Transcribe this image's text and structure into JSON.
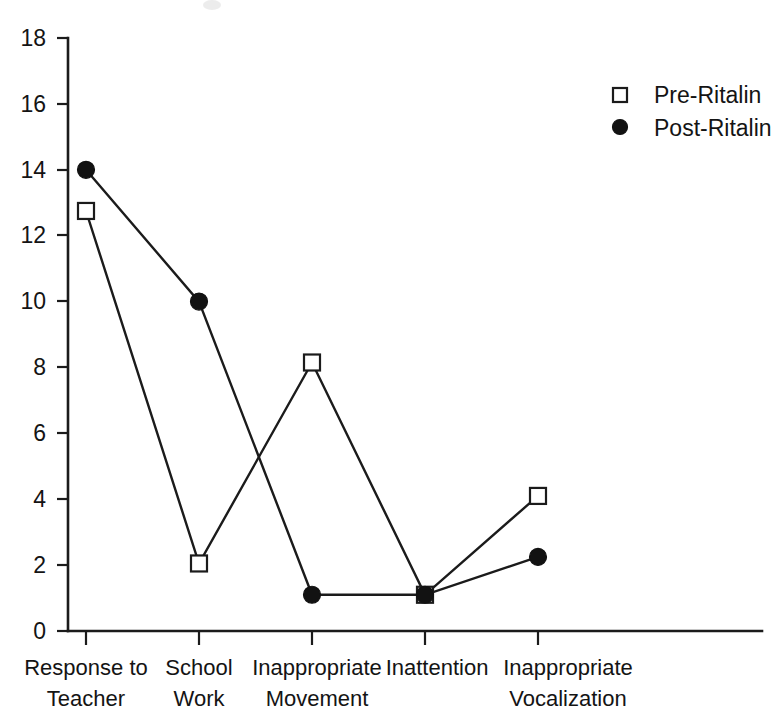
{
  "chart_data": {
    "type": "line",
    "title": "",
    "subtitle": "",
    "xlabel": "",
    "ylabel": "",
    "categories": [
      "Response to\nTeacher",
      "School\nWork",
      "Inappropriate\nMovement",
      "Inattention",
      "Inappropriate\nVocalization"
    ],
    "category_lines": [
      [
        "Response to",
        "Teacher"
      ],
      [
        "School",
        "Work"
      ],
      [
        "Inappropriate",
        "Movement"
      ],
      [
        "Inattention",
        ""
      ],
      [
        "Inappropriate",
        "Vocalization"
      ]
    ],
    "series": [
      {
        "name": "Pre-Ritalin",
        "marker": "open-square",
        "values": [
          12.75,
          2.05,
          8.15,
          1.1,
          4.1
        ]
      },
      {
        "name": "Post-Ritalin",
        "marker": "filled-circle",
        "values": [
          14.0,
          10.0,
          1.1,
          1.1,
          2.25
        ]
      }
    ],
    "ylim": [
      0,
      18
    ],
    "ytick_values": [
      0,
      2,
      4,
      6,
      8,
      10,
      12,
      14,
      16,
      18
    ],
    "ytick_labels": [
      "0",
      "2",
      "4",
      "6",
      "8",
      "10",
      "12",
      "14",
      "16",
      "18"
    ],
    "grid": false,
    "legend_position": "top-right",
    "legend_entries": [
      {
        "label": "Pre-Ritalin",
        "marker": "open-square"
      },
      {
        "label": "Post-Ritalin",
        "marker": "filled-circle"
      }
    ],
    "colors": {
      "line": "#1b1b1b",
      "marker_fill_open": "#ffffff",
      "marker_fill_solid": "#121212",
      "axis": "#1b1b1b",
      "text": "#141414",
      "background": "#ffffff"
    }
  }
}
